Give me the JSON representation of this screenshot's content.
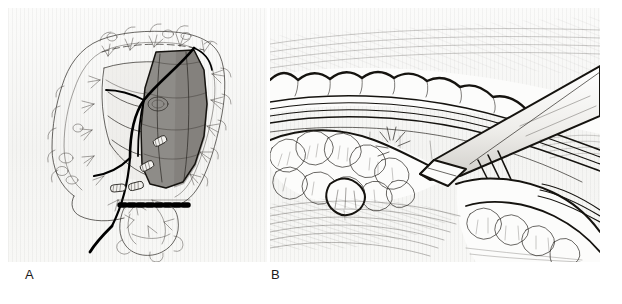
{
  "figure": {
    "kind": "surgical-anatomical-illustration",
    "style": "pen-and-ink line drawing with halftone shading",
    "background_color": "#ffffff",
    "panel_paper_color": "#f7f7f6",
    "ink_color": "#15130f",
    "shade_color": "#8e8c88",
    "panel_count": 2
  },
  "panels": [
    {
      "id": "A",
      "label": "A",
      "caption_position": "bottom-left",
      "subject": "large bowel (colon) with shaded segment marked for resection",
      "depicts": [
        "ascending colon",
        "transverse colon",
        "descending colon",
        "sigmoid colon",
        "rectum",
        "cecum",
        "small bowel mesentery",
        "mesenteric vascular arcade",
        "marginal artery",
        "inferior mesenteric artery",
        "vascular ligature clips",
        "dashed transection / staple line",
        "epiploic appendages"
      ],
      "annotations": {
        "shaded_segment": "resection specimen (descending / sigmoid colon)",
        "clip_count": 4,
        "dashed_line": "distal transection line"
      }
    },
    {
      "id": "B",
      "label": "B",
      "caption_position": "bottom-left",
      "subject": "close-up of mesocolic dissection with surgical instrument",
      "depicts": [
        "colon wall with haustra",
        "taenia coli",
        "epiploic appendages / fatty lobules",
        "mesenteric fat",
        "avascular plane",
        "dissecting forceps",
        "retroperitoneal tissue hatching"
      ],
      "annotations": {
        "instrument": "dissecting instrument entering from upper right",
        "instrument_bands": 3
      }
    }
  ],
  "labels": {
    "panel_a": "A",
    "panel_b": "B"
  }
}
